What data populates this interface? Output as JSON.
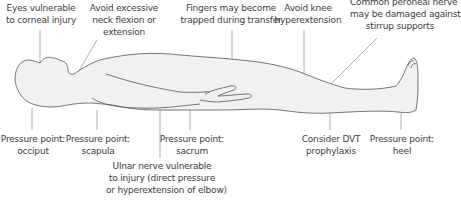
{
  "colors": {
    "body_fill": "#f1f1f1",
    "body_outline": "#555555",
    "leader_line": "#777777",
    "text": "#3c3c3c"
  },
  "top_labels": [
    {
      "id": "eyes",
      "lines": [
        "Eyes vulnerable",
        "to corneal injury"
      ]
    },
    {
      "id": "neck",
      "lines": [
        "Avoid excessive",
        "neck flexion or",
        "extension"
      ]
    },
    {
      "id": "fingers",
      "lines": [
        "Fingers may become",
        "trapped during transfer"
      ]
    },
    {
      "id": "knee",
      "lines": [
        "Avoid knee",
        "hyperextension"
      ]
    },
    {
      "id": "peroneal",
      "lines": [
        "Common peroneal nerve",
        "may be damaged against",
        "stirrup supports"
      ]
    }
  ],
  "bottom_labels": [
    {
      "id": "occiput",
      "lines": [
        "Pressure point:",
        "occiput"
      ]
    },
    {
      "id": "scapula",
      "lines": [
        "Pressure point:",
        "scapula"
      ]
    },
    {
      "id": "ulnar",
      "lines": [
        "Ulnar nerve vulnerable",
        "to injury (direct pressure",
        "or hyperextension of elbow)"
      ]
    },
    {
      "id": "sacrum",
      "lines": [
        "Pressure point:",
        "sacrum"
      ]
    },
    {
      "id": "dvt",
      "lines": [
        "Consider DVT",
        "prophylaxis"
      ]
    },
    {
      "id": "heel",
      "lines": [
        "Pressure point:",
        "heel"
      ]
    }
  ]
}
